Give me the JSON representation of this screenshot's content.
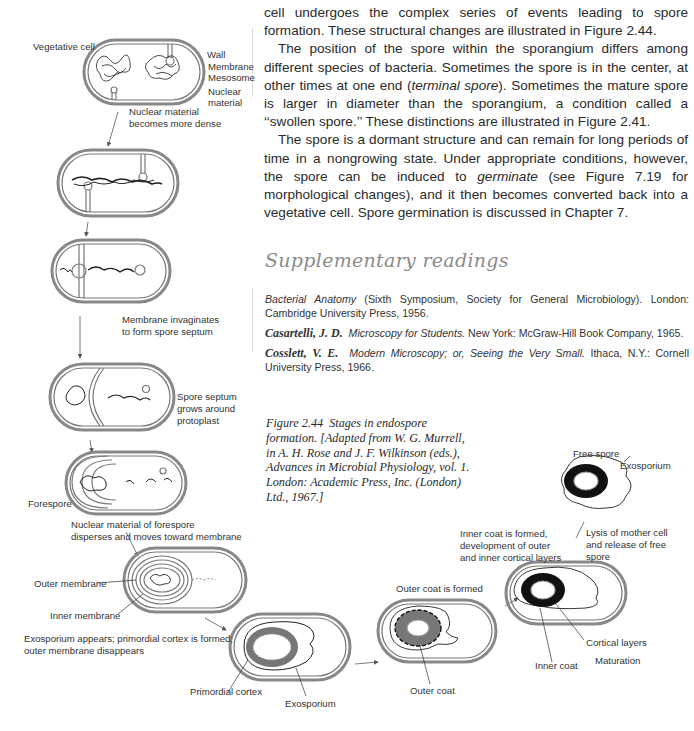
{
  "body_text": {
    "paragraphs": [
      {
        "before": "cell undergoes the complex series of events leading to spore formation. These structural changes are illustrated in Figure 2.44.",
        "italic": "",
        "after": ""
      },
      {
        "before": "The position of the spore within the sporangium differs among different species of bacteria. Sometimes the spore is in the center, at other times at one end (",
        "italic": "terminal spore",
        "after": "). Sometimes the mature spore is larger in diameter than the sporangium, a condition called a ‘‘swollen spore.’’ These distinctions are illustrated in Figure 2.41."
      },
      {
        "before": "The spore is a dormant structure and can remain for long periods of time in a nongrowing state. Under appropriate conditions, however, the spore can be induced to ",
        "italic": "germinate",
        "after": " (see Figure 7.19 for morphological changes), and it then becomes converted back into a vegetative cell. Spore germination is discussed in Chapter 7."
      }
    ]
  },
  "supplementary": {
    "title": "Supplementary readings",
    "references": [
      {
        "author": "",
        "title": "Bacterial Anatomy",
        "rest": " (Sixth Symposium, Society for General Microbiology). London: Cambridge University Press, 1956."
      },
      {
        "author": "Casartelli, J. D.",
        "title": "Microscopy for Students.",
        "rest": " New York: McGraw-Hill Book Company, 1965."
      },
      {
        "author": "Cosslett, V. E.",
        "title": "Modern Microscopy; or, Seeing the Very Small.",
        "rest": " Ithaca, N.Y.: Cornell University Press, 1966."
      }
    ]
  },
  "caption": {
    "label": "Figure 2.44",
    "text": "Stages in endospore formation. [Adapted from W. G. Murrell, in A. H. Rose and J. F. Wilkinson (eds.), Advances in Microbial Physiology, vol. 1. London: Academic Press, Inc. (London) Ltd., 1967.]"
  },
  "figure": {
    "labels": {
      "vegetative_cell": "Vegetative cell",
      "wall": "Wall",
      "membrane": "Membrane",
      "mesosome": "Mesosome",
      "nuclear_material_1": "Nuclear",
      "nuclear_material_2": "material",
      "step1_1": "Nuclear material",
      "step1_2": "becomes more dense",
      "step3_1": "Membrane invaginates",
      "step3_2": "to form spore septum",
      "step4_1": "Spore septum",
      "step4_2": "grows around",
      "step4_3": "protoplast",
      "forespore": "Forespore",
      "step5_1": "Nuclear material of forespore",
      "step5_2": "disperses and moves toward membrane",
      "outer_membrane": "Outer membrane",
      "inner_membrane": "Inner membrane",
      "step7_1": "Exosporium appears; primordial cortex is formed;",
      "step7_2": "outer membrane disappears",
      "primordial_cortex": "Primordial cortex",
      "exosporium_1": "Exosporium",
      "outer_coat_formed": "Outer coat is formed",
      "outer_coat": "Outer coat",
      "step9_1": "Inner coat is formed,",
      "step9_2": "development of outer",
      "step9_3": "and inner cortical layers",
      "cortical_layers": "Cortical layers",
      "inner_coat": "Inner coat",
      "maturation": "Maturation",
      "lysis_1": "Lysis of mother cell",
      "lysis_2": "and release of free",
      "lysis_3": "spore",
      "free_spore": "Free spore",
      "exosporium_2": "Exosporium"
    }
  }
}
